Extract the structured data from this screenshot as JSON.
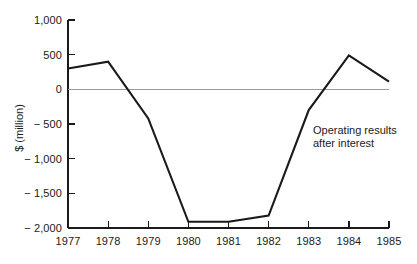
{
  "chart_data": {
    "type": "line",
    "title": "",
    "subtitle": "",
    "xlabel": "",
    "ylabel": "$ (million)",
    "categories": [
      "1977",
      "1978",
      "1979",
      "1980",
      "1981",
      "1982",
      "1983",
      "1984",
      "1985"
    ],
    "x": [
      1977,
      1978,
      1979,
      1980,
      1981,
      1982,
      1983,
      1984,
      1985
    ],
    "values": [
      300,
      400,
      -420,
      -1910,
      -1910,
      -1820,
      -300,
      490,
      110
    ],
    "series": [
      {
        "name": "Operating results after interest",
        "values": [
          300,
          400,
          -420,
          -1910,
          -1910,
          -1820,
          -300,
          490,
          110
        ]
      }
    ],
    "ylim": [
      -2000,
      1000
    ],
    "yticks": [
      1000,
      500,
      0,
      -500,
      -1000,
      -1500,
      -2000
    ],
    "ytick_labels": [
      "1,000",
      "500",
      "0",
      "− 500",
      "− 1,000",
      "− 1,500",
      "− 2,000"
    ],
    "xtick_labels": [
      "1977",
      "1978",
      "1979",
      "1980",
      "1981",
      "1982",
      "1983",
      "1984",
      "1985"
    ],
    "grid": false,
    "zero_line": true,
    "legend": "none",
    "annotations": [
      {
        "name": "series-annotation",
        "line1": "Operating results",
        "line2": "after interest"
      }
    ],
    "colors": {
      "line": "#1a1a1a",
      "axis": "#1a1a1a",
      "zero_line": "#9a9a9a",
      "background": "#ffffff"
    }
  }
}
